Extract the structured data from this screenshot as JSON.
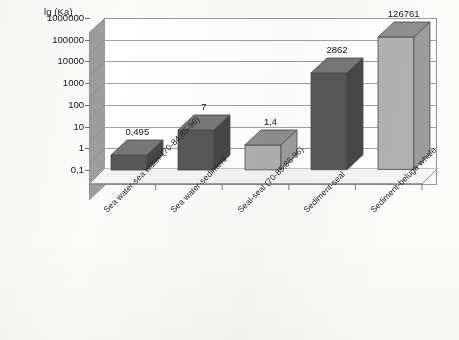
{
  "chart_data": {
    "type": "bar",
    "title": "",
    "ylabel": "lg (Ka)",
    "xlabel": "",
    "grid": true,
    "legend": "none",
    "log_scale": true,
    "ylim": [
      0.1,
      1000000
    ],
    "ytick_labels": [
      "1000000",
      "100000",
      "10000",
      "1000",
      "100",
      "10",
      "1",
      "0,1"
    ],
    "ytick_values": [
      1000000,
      100000,
      10000,
      1000,
      100,
      10,
      1,
      0.1
    ],
    "categories": [
      "Sea water-sea water (70-84;85-96)",
      "Sea water-sediment",
      "Seal-seal (70-85;86-96)",
      "Sediment-seal",
      "Sediment-beluga whale"
    ],
    "values": [
      0.495,
      7,
      1.4,
      2862,
      126761
    ],
    "data_labels": [
      "0,495",
      "7",
      "1,4",
      "2862",
      "126761"
    ],
    "bar_colors": [
      "#575757",
      "#575757",
      "#b0b0b0",
      "#575757",
      "#b0b0b0"
    ],
    "bar_shades": [
      "dark",
      "dark",
      "light",
      "dark",
      "light"
    ]
  },
  "colors": {
    "bar_dark_front": "#575757",
    "bar_dark_top": "#777777",
    "bar_dark_side": "#474747",
    "bar_light_front": "#b0b0b0",
    "bar_light_top": "#8f8f8f",
    "bar_light_side": "#9c9c9c",
    "wall": "#9a9a9a",
    "gridline": "#a2a2a2",
    "sidewall": "#9d9d9d",
    "floor": "#f2f2f2",
    "plot_bg": "#ffffff",
    "text": "#1a1a1a"
  }
}
